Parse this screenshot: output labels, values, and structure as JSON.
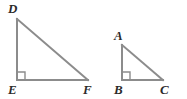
{
  "figure": {
    "type": "geometry-diagram",
    "background_color": "#ffffff",
    "stroke_color": "#8c8c8c",
    "stroke_width": 2,
    "label_color": "#2b2b2b",
    "label_font_size": 13,
    "canvas": {
      "width": 187,
      "height": 99
    },
    "shapes": [
      {
        "name": "triangle-def",
        "label": "DEF",
        "right_angle_at": "E",
        "right_angle_marker": {
          "x": 17,
          "y": 80,
          "size": 8
        },
        "vertices": [
          {
            "id": "D",
            "label": "D",
            "x": 17,
            "y": 19,
            "label_x": 8,
            "label_y": 2
          },
          {
            "id": "E",
            "label": "E",
            "x": 17,
            "y": 80,
            "label_x": 8,
            "label_y": 83
          },
          {
            "id": "F",
            "label": "F",
            "x": 88,
            "y": 80,
            "label_x": 83,
            "label_y": 83
          }
        ],
        "edges": [
          {
            "name": "edge-DE",
            "from": "D",
            "to": "E"
          },
          {
            "name": "edge-EF",
            "from": "E",
            "to": "F"
          },
          {
            "name": "edge-DF",
            "from": "D",
            "to": "F"
          }
        ]
      },
      {
        "name": "triangle-abc",
        "label": "ABC",
        "right_angle_at": "B",
        "right_angle_marker": {
          "x": 122,
          "y": 80,
          "size": 8
        },
        "vertices": [
          {
            "id": "A",
            "label": "A",
            "x": 122,
            "y": 45,
            "label_x": 114,
            "label_y": 29
          },
          {
            "id": "B",
            "label": "B",
            "x": 122,
            "y": 80,
            "label_x": 114,
            "label_y": 83
          },
          {
            "id": "C",
            "label": "C",
            "x": 163,
            "y": 80,
            "label_x": 160,
            "label_y": 83
          }
        ],
        "edges": [
          {
            "name": "edge-AB",
            "from": "A",
            "to": "B"
          },
          {
            "name": "edge-BC",
            "from": "B",
            "to": "C"
          },
          {
            "name": "edge-AC",
            "from": "A",
            "to": "C"
          }
        ]
      }
    ]
  }
}
